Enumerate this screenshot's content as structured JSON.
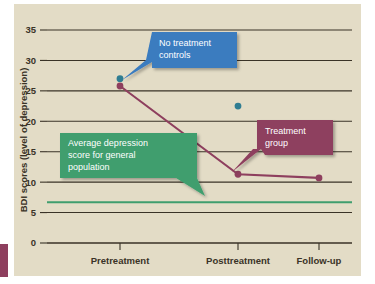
{
  "figure": {
    "background_color": "#ffffff",
    "plate_color": "#e3dcc6",
    "left_tab_color": "#8e3f5e"
  },
  "chart_data": {
    "type": "line",
    "title": "",
    "xlabel": "",
    "ylabel": "BDI scores (level of depression)",
    "categories": [
      "Pretreatment",
      "Posttreatment",
      "Follow-up"
    ],
    "ylim": [
      0,
      35
    ],
    "yticks": [
      0,
      5,
      10,
      15,
      20,
      25,
      30,
      35
    ],
    "ytick_labels": [
      "0",
      "5",
      "10",
      "15",
      "20",
      "25",
      "30",
      "35"
    ],
    "grid": true,
    "legend_position": "annotations",
    "series": [
      {
        "name": "No treatment controls",
        "color": "#2f7d92",
        "marker": "circle",
        "line": false,
        "x": [
          "Pretreatment",
          "Posttreatment"
        ],
        "values": [
          27.0,
          22.5
        ]
      },
      {
        "name": "Treatment group",
        "color": "#8e3f5e",
        "marker": "circle",
        "line": true,
        "x": [
          "Pretreatment",
          "Posttreatment",
          "Follow-up"
        ],
        "values": [
          25.8,
          11.3,
          10.7
        ]
      },
      {
        "name": "Average depression score for general population",
        "color": "#3f9e6e",
        "marker": "none",
        "line": true,
        "type": "reference-line",
        "values": [
          6.7,
          6.7,
          6.7
        ]
      }
    ],
    "annotations": [
      {
        "id": "no-treatment-controls",
        "text_lines": [
          "No treatment",
          "controls"
        ],
        "fill": "#3a7bbf",
        "text_color": "#ffffff",
        "points_to": "No treatment controls pretreatment point"
      },
      {
        "id": "treatment-group",
        "text_lines": [
          "Treatment",
          "group"
        ],
        "fill": "#8e3f5e",
        "text_color": "#ffffff",
        "points_to": "Treatment group posttreatment point"
      },
      {
        "id": "average-population",
        "text_lines": [
          "Average depression",
          "score for general",
          "population"
        ],
        "fill": "#3f9e6e",
        "text_color": "#ffffff",
        "points_to": "General population reference line"
      }
    ]
  }
}
